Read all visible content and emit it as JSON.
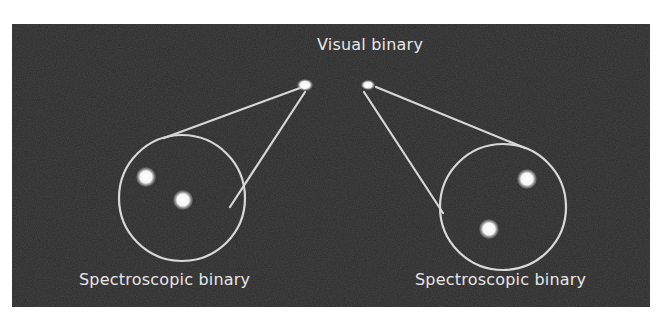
{
  "diagram": {
    "title": "Visual binary",
    "labels": {
      "visual": "Visual binary",
      "spectroscopic_left": "Spectroscopic binary",
      "spectroscopic_right": "Spectroscopic binary"
    },
    "colors": {
      "background": "#2b2b2b",
      "line": "#d8d8d8",
      "star": "#ffffff",
      "text": "#e6e6e6"
    },
    "nodes": [
      {
        "id": "visual-star-left",
        "type": "star",
        "x": 293,
        "y": 61,
        "r": 6
      },
      {
        "id": "visual-star-right",
        "type": "star",
        "x": 356,
        "y": 61,
        "r": 5
      },
      {
        "id": "spectroscopic-circle-left",
        "type": "circle",
        "cx": 170,
        "cy": 174,
        "r": 63,
        "stars": [
          {
            "x": 134,
            "y": 153,
            "r": 9
          },
          {
            "x": 171,
            "y": 176,
            "r": 9
          }
        ]
      },
      {
        "id": "spectroscopic-circle-right",
        "type": "circle",
        "cx": 491,
        "cy": 183,
        "r": 63,
        "stars": [
          {
            "x": 515,
            "y": 155,
            "r": 9
          },
          {
            "x": 477,
            "y": 205,
            "r": 9
          }
        ]
      }
    ],
    "connectors": [
      {
        "from": "visual-star-left",
        "to": "spectroscopic-circle-left",
        "x1": 288,
        "y1": 64,
        "x2": 152,
        "y2": 114
      },
      {
        "from": "visual-star-left",
        "to": "spectroscopic-circle-left",
        "x1": 293,
        "y1": 68,
        "x2": 218,
        "y2": 183
      },
      {
        "from": "visual-star-right",
        "to": "spectroscopic-circle-right",
        "x1": 364,
        "y1": 63,
        "x2": 513,
        "y2": 124
      },
      {
        "from": "visual-star-right",
        "to": "spectroscopic-circle-right",
        "x1": 352,
        "y1": 68,
        "x2": 431,
        "y2": 189
      }
    ]
  }
}
